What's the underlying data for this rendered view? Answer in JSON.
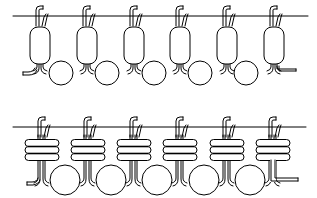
{
  "diagram": {
    "colors": {
      "line": "#000000",
      "fill": "#ffffff",
      "background": "#ffffff"
    },
    "rows": [
      {
        "id": "top-row",
        "membrane_y": 16,
        "membrane_x": [
          13,
          308
        ],
        "domain_shape": "capsule",
        "unit_centers_x": [
          40,
          87,
          134,
          180,
          227,
          274
        ],
        "domain_y": [
          27,
          64
        ],
        "circle_centers_x": [
          61,
          107,
          154,
          200,
          246
        ],
        "circle_y": 73,
        "circle_r": 12
      },
      {
        "id": "bottom-row",
        "membrane_y": 127,
        "membrane_x": [
          13,
          306
        ],
        "domain_shape": "coil-3-loops",
        "unit_centers_x": [
          42,
          88,
          134,
          180,
          227,
          273
        ],
        "coil_y": [
          143,
          150,
          157
        ],
        "circle_centers_x": [
          65,
          111,
          157,
          204,
          250
        ],
        "circle_y": 180,
        "circle_r": 15
      }
    ]
  }
}
